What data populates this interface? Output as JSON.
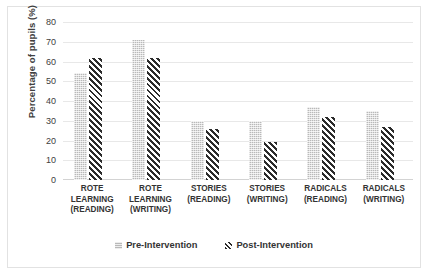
{
  "chart_data": {
    "type": "bar",
    "title": "",
    "xlabel": "",
    "ylabel": "Percentage of pupils (%)",
    "ylim": [
      0,
      80
    ],
    "yticks": [
      0,
      10,
      20,
      30,
      40,
      50,
      60,
      70,
      80
    ],
    "grid": true,
    "legend_position": "bottom",
    "categories": [
      "ROTE LEARNING (READING)",
      "ROTE LEARNING (WRITING)",
      "STORIES (READING)",
      "STORIES (WRITING)",
      "RADICALS (READING)",
      "RADICALS (WRITING)"
    ],
    "category_lines": [
      [
        "ROTE",
        "LEARNING",
        "(READING)"
      ],
      [
        "ROTE",
        "LEARNING",
        "(WRITING)"
      ],
      [
        "STORIES",
        "(READING)"
      ],
      [
        "STORIES",
        "(WRITING)"
      ],
      [
        "RADICALS",
        "(READING)"
      ],
      [
        "RADICALS",
        "(WRITING)"
      ]
    ],
    "series": [
      {
        "name": "Pre-Intervention",
        "values": [
          54,
          71,
          30,
          30,
          37,
          35
        ]
      },
      {
        "name": "Post-Intervention",
        "values": [
          62,
          62,
          26,
          19,
          32,
          27
        ]
      }
    ],
    "colors": {
      "pre_intervention": "#b9b9b9",
      "post_intervention": "#2b2b2b",
      "gridline": "#e8e8e8",
      "text": "#333333",
      "frame": "#e2e2e2"
    }
  },
  "legend": {
    "entries": [
      {
        "label": "Pre-Intervention",
        "swatch": "dotted-square-icon"
      },
      {
        "label": "Post-Intervention",
        "swatch": "hatched-square-icon"
      }
    ]
  }
}
